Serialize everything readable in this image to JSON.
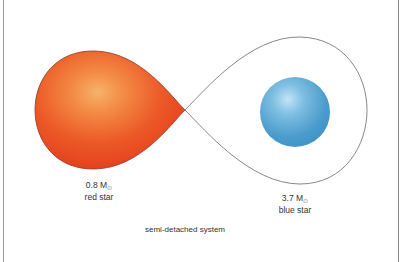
{
  "diagram": {
    "title": "semi-detached system",
    "colors": {
      "red_star_edge": "#e8401c",
      "red_star_highlight": "#f7b26a",
      "blue_star_edge": "#3f93c4",
      "blue_star_highlight": "#b9def2",
      "roche_lobe_outline": "#666666",
      "frame": "#9a9a9a"
    },
    "stars": [
      {
        "name": "red star",
        "mass_value": "0.8 M",
        "mass_symbol": "⊙",
        "fills_roche_lobe": true
      },
      {
        "name": "blue star",
        "mass_value": "3.7 M",
        "mass_symbol": "⊙",
        "fills_roche_lobe": false
      }
    ],
    "elements": {
      "left_lobe": "Roche lobe filled by red star",
      "right_lobe": "Roche lobe of blue star",
      "contact_point": "inner Lagrangian point"
    }
  }
}
